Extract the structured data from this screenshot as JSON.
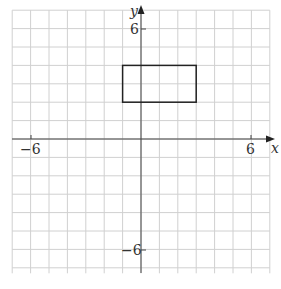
{
  "chart_data": {
    "type": "scatter",
    "title": "",
    "xlabel": "x",
    "ylabel": "y",
    "xlim": [
      -7,
      7
    ],
    "ylim": [
      -7,
      7
    ],
    "grid": true,
    "x_tick_labels": [
      "-6",
      "6"
    ],
    "y_tick_labels": [
      "6",
      "-6"
    ],
    "shapes": [
      {
        "type": "rectangle",
        "vertices": [
          [
            -1,
            2
          ],
          [
            3,
            2
          ],
          [
            3,
            4
          ],
          [
            -1,
            4
          ]
        ]
      }
    ]
  },
  "labels": {
    "x_axis": "x",
    "y_axis": "y",
    "x_neg": "−6",
    "x_pos": "6",
    "y_pos": "6",
    "y_neg": "−6"
  },
  "colors": {
    "grid": "#d0d0d0",
    "axis": "#444444",
    "shape": "#222222"
  }
}
